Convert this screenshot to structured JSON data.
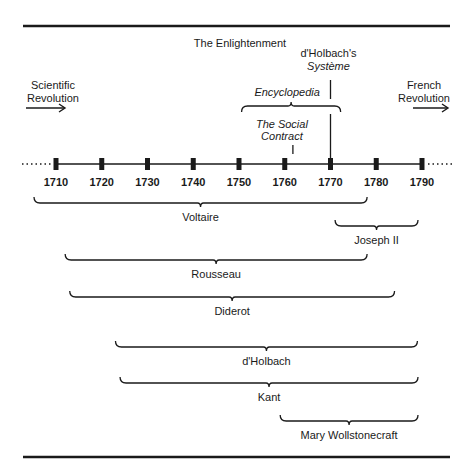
{
  "title": "The Enlightenment",
  "left_context": {
    "lines": [
      "Scientific",
      "Revolution"
    ],
    "arrow": "right-arrow"
  },
  "right_context": {
    "lines": [
      "French",
      "Revolution"
    ],
    "arrow": "right-arrow"
  },
  "timeline": {
    "start_year": 1710,
    "end_year": 1790,
    "step": 10,
    "years": [
      "1710",
      "1720",
      "1730",
      "1740",
      "1750",
      "1760",
      "1770",
      "1780",
      "1790"
    ],
    "continues_left": true,
    "continues_right": true
  },
  "events": [
    {
      "id": "encyclopedia",
      "label_lines": [
        "Encyclopedia"
      ],
      "italic": true,
      "type": "span",
      "start": 1751,
      "end": 1772
    },
    {
      "id": "social-contract",
      "label_lines": [
        "The Social",
        "Contract"
      ],
      "italic": true,
      "type": "point",
      "year": 1762
    },
    {
      "id": "systeme",
      "label_lines": [
        "d'Holbach's",
        "Système"
      ],
      "italic_lines": [
        false,
        true
      ],
      "type": "point",
      "year": 1770
    }
  ],
  "lifespans": [
    {
      "name": "Voltaire",
      "start": 1694,
      "end": 1778
    },
    {
      "name": "Joseph II",
      "start": 1771,
      "end": 1790
    },
    {
      "name": "Rousseau",
      "start": 1712,
      "end": 1778
    },
    {
      "name": "Diderot",
      "start": 1713,
      "end": 1784
    },
    {
      "name": "d'Holbach",
      "start": 1723,
      "end": 1789
    },
    {
      "name": "Kant",
      "start": 1724,
      "end": 1804
    },
    {
      "name": "Mary Wollstonecraft",
      "start": 1759,
      "end": 1797
    }
  ],
  "colors": {
    "ink": "#1a1a1a",
    "background": "#ffffff"
  }
}
